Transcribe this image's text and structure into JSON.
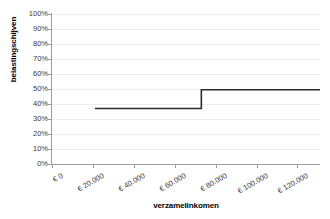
{
  "chart_data": {
    "type": "line",
    "title": "",
    "xlabel": "verzamelinkomen",
    "ylabel": "belastingschijven",
    "xlim": [
      0,
      131000
    ],
    "ylim": [
      0,
      1
    ],
    "grid": true,
    "legend": false,
    "step": "post",
    "x_tick_values": [
      0,
      20000,
      40000,
      60000,
      80000,
      100000,
      120000
    ],
    "x_tick_labels": [
      "€ 0",
      "€ 20.000",
      "€ 40.000",
      "€ 60.000",
      "€ 80.000",
      "€ 100.000",
      "€ 120.000"
    ],
    "y_tick_values": [
      0,
      0.1,
      0.2,
      0.3,
      0.4,
      0.5,
      0.6,
      0.7,
      0.8,
      0.9,
      1.0
    ],
    "y_tick_labels": [
      "0%",
      "10%",
      "20%",
      "30%",
      "40%",
      "50%",
      "60%",
      "70%",
      "80%",
      "90%",
      "100%"
    ],
    "series": [
      {
        "name": "belastingschijven",
        "color": "#2b2b2b",
        "x": [
          21000,
          73000,
          73000,
          131000
        ],
        "y": [
          0.37,
          0.37,
          0.495,
          0.495
        ]
      }
    ],
    "annotations": []
  },
  "axes": {
    "axis_color": "#9a9a9a",
    "grid_color": "#ededed",
    "tick_text_color": "#3b3b3b",
    "title_text_color": "#000000",
    "background": "#ffffff"
  }
}
